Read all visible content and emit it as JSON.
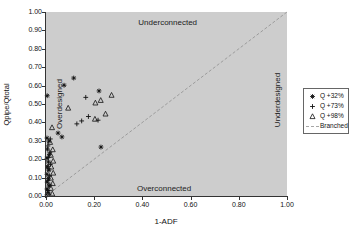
{
  "chart_data": {
    "type": "scatter",
    "title": "",
    "xlabel": "1-ADF",
    "ylabel": "Qpipe/Qtotal",
    "xlim": [
      0,
      1
    ],
    "ylim": [
      0,
      1
    ],
    "grid": false,
    "legend_position": "right-outside",
    "x_ticks": [
      "0.00",
      "0.20",
      "0.40",
      "0.60",
      "0.80",
      "1.00"
    ],
    "y_ticks": [
      "0.00",
      "0.10",
      "0.20",
      "0.30",
      "0.40",
      "0.50",
      "0.60",
      "0.70",
      "0.80",
      "0.90",
      "1.00"
    ],
    "colors": {
      "plot_bg": "#cdcdcd",
      "axis": "#333333",
      "marker": "#111111",
      "branched_line": "#8f8f8f",
      "legend_border": "#666666",
      "text": "#111111"
    },
    "annotations": [
      {
        "text": "Underconnected",
        "x": 0.505,
        "y": 0.945,
        "rotate": 0
      },
      {
        "text": "Overconnected",
        "x": 0.49,
        "y": 0.045,
        "rotate": 0
      },
      {
        "text": "Overdesigned",
        "x": 0.055,
        "y": 0.5,
        "rotate": -90
      },
      {
        "text": "Underdesigned",
        "x": 0.958,
        "y": 0.52,
        "rotate": -90
      }
    ],
    "series": [
      {
        "name": "Q +32%",
        "marker": "asterisk",
        "color": "#111111",
        "points": [
          [
            0.005,
            0.545
          ],
          [
            0.075,
            0.602
          ],
          [
            0.115,
            0.641
          ],
          [
            0.22,
            0.571
          ],
          [
            0.228,
            0.266
          ],
          [
            0.05,
            0.342
          ],
          [
            0.066,
            0.321
          ],
          [
            0.004,
            0.315
          ],
          [
            0.012,
            0.298
          ],
          [
            0.006,
            0.255
          ],
          [
            0.014,
            0.225
          ],
          [
            0.004,
            0.205
          ],
          [
            0.01,
            0.185
          ],
          [
            0.006,
            0.16
          ],
          [
            0.012,
            0.14
          ],
          [
            0.004,
            0.118
          ],
          [
            0.01,
            0.096
          ],
          [
            0.005,
            0.075
          ],
          [
            0.012,
            0.055
          ],
          [
            0.004,
            0.038
          ],
          [
            0.009,
            0.02
          ],
          [
            0.004,
            0.006
          ]
        ]
      },
      {
        "name": "Q +73%",
        "marker": "plus",
        "color": "#111111",
        "points": [
          [
            0.165,
            0.536
          ],
          [
            0.128,
            0.392
          ],
          [
            0.148,
            0.408
          ],
          [
            0.176,
            0.432
          ],
          [
            0.216,
            0.412
          ],
          [
            0.018,
            0.31
          ],
          [
            0.008,
            0.272
          ],
          [
            0.016,
            0.238
          ],
          [
            0.009,
            0.21
          ],
          [
            0.018,
            0.172
          ],
          [
            0.008,
            0.148
          ],
          [
            0.015,
            0.11
          ],
          [
            0.008,
            0.085
          ],
          [
            0.016,
            0.06
          ],
          [
            0.007,
            0.03
          ],
          [
            0.013,
            0.01
          ]
        ]
      },
      {
        "name": "Q +98%",
        "marker": "triangle-open",
        "color": "#111111",
        "points": [
          [
            0.092,
            0.478
          ],
          [
            0.205,
            0.506
          ],
          [
            0.272,
            0.548
          ],
          [
            0.227,
            0.52
          ],
          [
            0.247,
            0.446
          ],
          [
            0.203,
            0.418
          ],
          [
            0.025,
            0.372
          ],
          [
            0.017,
            0.292
          ],
          [
            0.028,
            0.252
          ],
          [
            0.02,
            0.222
          ],
          [
            0.03,
            0.19
          ],
          [
            0.022,
            0.158
          ],
          [
            0.03,
            0.125
          ],
          [
            0.02,
            0.098
          ],
          [
            0.028,
            0.068
          ],
          [
            0.02,
            0.042
          ],
          [
            0.026,
            0.012
          ]
        ]
      },
      {
        "name": "Branched",
        "marker": "dashed-line",
        "color": "#8f8f8f",
        "line": {
          "from": [
            0,
            0
          ],
          "to": [
            1,
            1
          ]
        }
      }
    ]
  }
}
